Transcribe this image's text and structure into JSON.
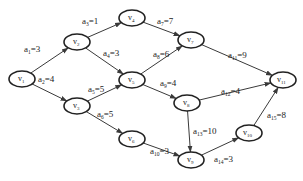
{
  "diagram": {
    "type": "AOE network (directed acyclic graph)",
    "colors": {
      "stroke": "#3a3a3a",
      "node_border": "#222222",
      "background": "#ffffff"
    },
    "nodes": [
      {
        "id": "v1",
        "base": "v",
        "sub": "1",
        "x": 22,
        "y": 79
      },
      {
        "id": "v2",
        "base": "v",
        "sub": "2",
        "x": 77,
        "y": 42
      },
      {
        "id": "v3",
        "base": "v",
        "sub": "3",
        "x": 77,
        "y": 106
      },
      {
        "id": "v4",
        "base": "v",
        "sub": "4",
        "x": 132,
        "y": 18
      },
      {
        "id": "v5",
        "base": "v",
        "sub": "5",
        "x": 132,
        "y": 80
      },
      {
        "id": "v6",
        "base": "v",
        "sub": "6",
        "x": 132,
        "y": 139
      },
      {
        "id": "v7",
        "base": "v",
        "sub": "7",
        "x": 191,
        "y": 40
      },
      {
        "id": "v8",
        "base": "v",
        "sub": "8",
        "x": 187,
        "y": 103
      },
      {
        "id": "v9",
        "base": "v",
        "sub": "9",
        "x": 191,
        "y": 160
      },
      {
        "id": "v10",
        "base": "v",
        "sub": "10",
        "x": 249,
        "y": 133
      },
      {
        "id": "v11",
        "base": "v",
        "sub": "11",
        "x": 283,
        "y": 80
      }
    ],
    "edges": [
      {
        "from": "v1",
        "to": "v2",
        "name": "a",
        "sub": "1",
        "weight": "3",
        "lx": 24,
        "ly": 52
      },
      {
        "from": "v1",
        "to": "v3",
        "name": "a",
        "sub": "2",
        "weight": "4",
        "lx": 38,
        "ly": 82
      },
      {
        "from": "v2",
        "to": "v4",
        "name": "a",
        "sub": "3",
        "weight": "1",
        "lx": 82,
        "ly": 24
      },
      {
        "from": "v2",
        "to": "v5",
        "name": "a",
        "sub": "4",
        "weight": "3",
        "lx": 103,
        "ly": 56
      },
      {
        "from": "v3",
        "to": "v5",
        "name": "a",
        "sub": "5",
        "weight": "5",
        "lx": 88,
        "ly": 92
      },
      {
        "from": "v3",
        "to": "v6",
        "name": "a",
        "sub": "6",
        "weight": "5",
        "lx": 97,
        "ly": 117
      },
      {
        "from": "v4",
        "to": "v7",
        "name": "a",
        "sub": "7",
        "weight": "7",
        "lx": 157,
        "ly": 24
      },
      {
        "from": "v5",
        "to": "v7",
        "name": "a",
        "sub": "8",
        "weight": "6",
        "lx": 153,
        "ly": 57
      },
      {
        "from": "v5",
        "to": "v8",
        "name": "a",
        "sub": "9",
        "weight": "4",
        "lx": 160,
        "ly": 86
      },
      {
        "from": "v6",
        "to": "v9",
        "name": "a",
        "sub": "10",
        "weight": "3",
        "lx": 150,
        "ly": 154
      },
      {
        "from": "v7",
        "to": "v11",
        "name": "a",
        "sub": "11",
        "weight": "9",
        "lx": 228,
        "ly": 58
      },
      {
        "from": "v8",
        "to": "v11",
        "name": "a",
        "sub": "12",
        "weight": "4",
        "lx": 221,
        "ly": 94
      },
      {
        "from": "v8",
        "to": "v9",
        "name": "a",
        "sub": "13",
        "weight": "10",
        "lx": 193,
        "ly": 134
      },
      {
        "from": "v9",
        "to": "v10",
        "name": "a",
        "sub": "14",
        "weight": "3",
        "lx": 214,
        "ly": 162
      },
      {
        "from": "v10",
        "to": "v11",
        "name": "a",
        "sub": "15",
        "weight": "8",
        "lx": 267,
        "ly": 118
      }
    ]
  }
}
